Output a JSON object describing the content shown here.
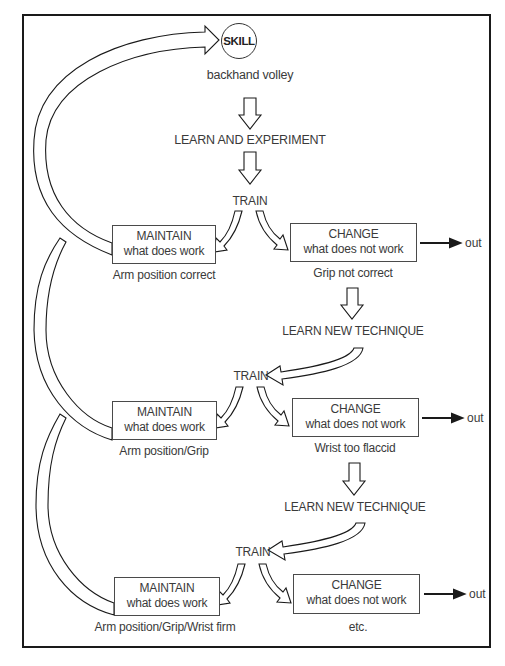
{
  "diagram": {
    "skill": {
      "label": "SKILL",
      "subject": "backhand volley"
    },
    "initial_stage": "LEARN AND EXPERIMENT",
    "cycles": [
      {
        "train_label": "TRAIN",
        "maintain": {
          "title": "MAINTAIN",
          "subtitle": "what does work",
          "note": "Arm position correct"
        },
        "change": {
          "title": "CHANGE",
          "subtitle": "what does not work",
          "note": "Grip not correct"
        },
        "out_label": "out",
        "next_stage": "LEARN NEW TECHNIQUE"
      },
      {
        "train_label": "TRAIN",
        "maintain": {
          "title": "MAINTAIN",
          "subtitle": "what does work",
          "note": "Arm position/Grip"
        },
        "change": {
          "title": "CHANGE",
          "subtitle": "what does not work",
          "note": "Wrist too flaccid"
        },
        "out_label": "out",
        "next_stage": "LEARN NEW TECHNIQUE"
      },
      {
        "train_label": "TRAIN",
        "maintain": {
          "title": "MAINTAIN",
          "subtitle": "what does work",
          "note": "Arm position/Grip/Wrist firm"
        },
        "change": {
          "title": "CHANGE",
          "subtitle": "what does not work",
          "note": "etc."
        },
        "out_label": "out"
      }
    ],
    "colors": {
      "line": "#1a1a1a",
      "text": "#3a3a3a",
      "background": "#ffffff"
    }
  }
}
